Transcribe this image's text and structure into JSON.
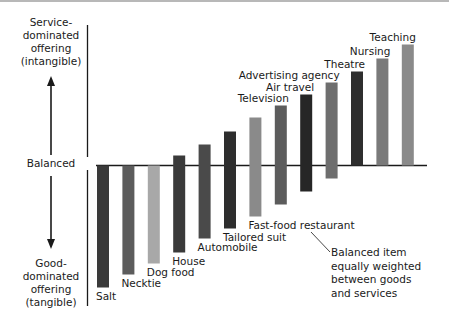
{
  "diagram": {
    "left_labels": {
      "top": [
        "Service-",
        "dominated",
        "offering",
        "(intangible)"
      ],
      "middle": "Balanced",
      "bottom": [
        "Good-",
        "dominated",
        "offering",
        "(tangible)"
      ]
    },
    "annotation": [
      "Balanced item",
      "equally weighted",
      "between goods",
      "and services"
    ]
  },
  "chart_data": {
    "type": "bar",
    "title": "",
    "subtitle": "Goods-services continuum (floating bars spanning goods-dominated to service-dominated)",
    "xlabel": "",
    "ylabel": "Service-dominated (up) vs Good-dominated (down)",
    "baseline_label": "Balanced",
    "grid": false,
    "legend": null,
    "ylim": [
      -125,
      125
    ],
    "categories": [
      "Salt",
      "Necktie",
      "Dog food",
      "House",
      "Automobile",
      "Tailored suit",
      "Fast-food restaurant",
      "Television",
      "Air travel",
      "Advertising agency",
      "Theatre",
      "Nursing",
      "Teaching"
    ],
    "series": [
      {
        "name": "service_top",
        "values": [
          0,
          0,
          0,
          10,
          21,
          34,
          48,
          60,
          71,
          83,
          94,
          107,
          121
        ]
      },
      {
        "name": "goods_bottom",
        "values": [
          -122,
          -109,
          -98,
          -87,
          -73,
          -63,
          -51,
          -39,
          -26,
          -13,
          0,
          0,
          0
        ]
      }
    ],
    "bar_colors": [
      "#3a3a3a",
      "#5c5c5c",
      "#a8a8a8",
      "#3a3a3a",
      "#4a4a4a",
      "#2e2e2e",
      "#8a8a8a",
      "#5c5c5c",
      "#262626",
      "#6e6e6e",
      "#2e2e2e",
      "#7a7a7a",
      "#8a8a8a"
    ],
    "annotations": [
      {
        "text": "Balanced item equally weighted between goods and services",
        "points_to": "Fast-food restaurant"
      }
    ]
  }
}
